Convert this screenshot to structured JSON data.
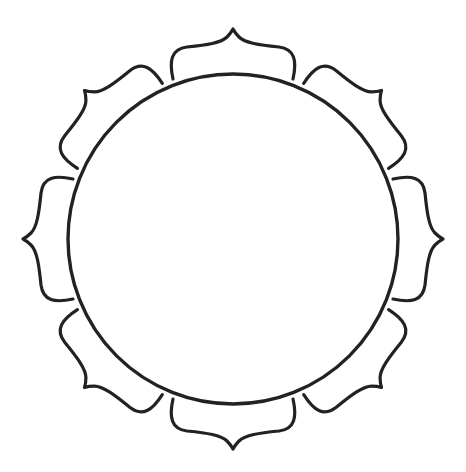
{
  "figure": {
    "type": "lotus-frame-outline",
    "petal_count": 8,
    "stroke_color": "#222222",
    "fill_color": "#ffffff",
    "center": [
      233,
      239
    ],
    "circle_radius": 165
  }
}
